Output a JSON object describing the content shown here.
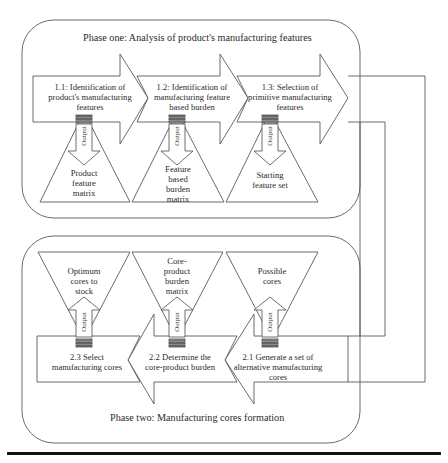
{
  "phase_one": {
    "title": "Phase one: Analysis of product's manufacturing features",
    "steps": [
      {
        "label": "1.1: Identification of product's manufacturing features",
        "lines": [
          "1.1: Identification of",
          "product's manufacturing",
          "features"
        ]
      },
      {
        "label": "1.2: Identification of manufacturing feature based burden",
        "lines": [
          "1.2: Identification of",
          "manufacturing feature",
          "based burden"
        ]
      },
      {
        "label": "1.3: Selection of primitive manufacturing features",
        "lines": [
          "1.3: Selection of",
          "primitive manufacturing",
          "features"
        ]
      }
    ],
    "outputs": [
      {
        "label": "Product feature matrix",
        "lines": [
          "Product",
          "feature",
          "matrix"
        ]
      },
      {
        "label": "Feature based burden matrix",
        "lines": [
          "Feature",
          "based",
          "burden",
          "matrix"
        ]
      },
      {
        "label": "Starting feature set",
        "lines": [
          "Starting",
          "feature set"
        ]
      }
    ]
  },
  "phase_two": {
    "title": "Phase two: Manufacturing cores formation",
    "steps": [
      {
        "label": "2.3 Select manufacturing cores",
        "lines": [
          "2.3 Select",
          "manufacturing cores"
        ]
      },
      {
        "label": "2.2 Determine the core-product burden",
        "lines": [
          "2.2 Determine the",
          "core-product burden"
        ]
      },
      {
        "label": "2.1 Generate a set of alternative manufacturing cores",
        "lines": [
          "2.1 Generate a set of",
          "alternative manufacturing",
          "cores"
        ]
      }
    ],
    "outputs": [
      {
        "label": "Optimum cores to stock",
        "lines": [
          "Optimum",
          "cores to",
          "stock"
        ]
      },
      {
        "label": "Core-product burden matrix",
        "lines": [
          "Core-",
          "product",
          "burden",
          "matrix"
        ]
      },
      {
        "label": "Possible cores",
        "lines": [
          "Possible",
          "cores"
        ]
      }
    ]
  },
  "output_arrow_label": "Output",
  "colors": {
    "stroke": "#555555",
    "text": "#2b2b2b",
    "rule": "#111111"
  }
}
